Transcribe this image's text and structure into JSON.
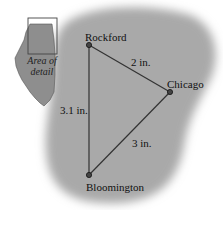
{
  "diagram": {
    "inset": {
      "label_line1": "Area of",
      "label_line2": "detail"
    },
    "cities": [
      {
        "name": "Rockford",
        "x": 89,
        "y": 45
      },
      {
        "name": "Chicago",
        "x": 170,
        "y": 92
      },
      {
        "name": "Bloomington",
        "x": 89,
        "y": 175
      }
    ],
    "distances": [
      {
        "from": "Rockford",
        "to": "Chicago",
        "label": "2 in."
      },
      {
        "from": "Rockford",
        "to": "Bloomington",
        "label": "3.1 in."
      },
      {
        "from": "Chicago",
        "to": "Bloomington",
        "label": "3 in."
      }
    ],
    "colors": {
      "region": "#a8a8a8",
      "state": "#8c8c8c",
      "line": "#333333"
    }
  }
}
